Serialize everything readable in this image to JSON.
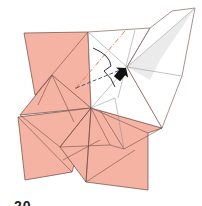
{
  "diagram": {
    "type": "origami-folding-step",
    "step_number": "20",
    "colors": {
      "paper_colored_side": "#f4b3a3",
      "paper_white_side": "#ffffff",
      "edge_line": "#6b4a42",
      "crease_line": "#8a8a8a",
      "valley_fold_line": "#e0703c",
      "mountain_fold_line": "#3a4a7a",
      "arrow": "#111111",
      "shadow": "#e6e6e6"
    },
    "annotations": [
      {
        "kind": "valley-fold-line",
        "description": "orange dash-dot line from center toward top edge"
      },
      {
        "kind": "mountain-fold-line",
        "description": "dark blue dashed line from left toward center point"
      },
      {
        "kind": "push-arrow",
        "description": "black push/squash arrow pointing into center flap"
      },
      {
        "kind": "rotation-arrow",
        "description": "curved arrow indicating fold movement"
      }
    ]
  }
}
